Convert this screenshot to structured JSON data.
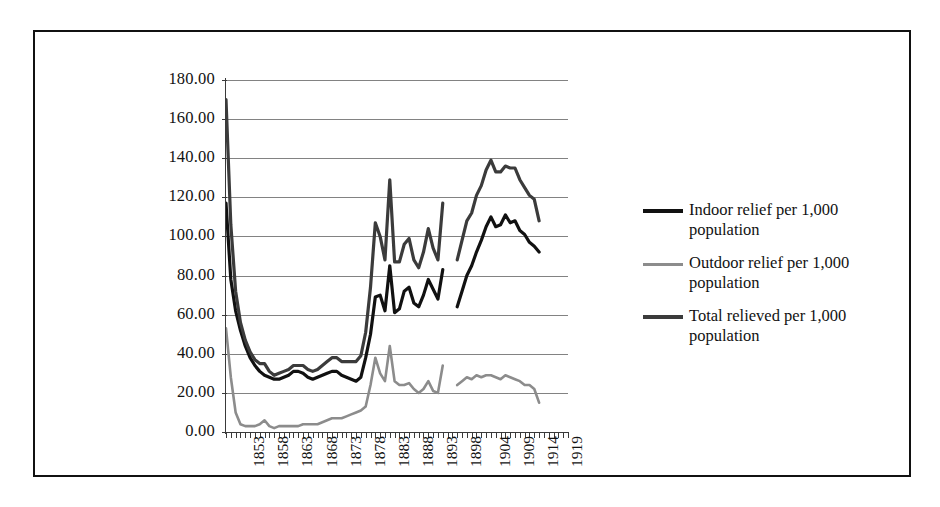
{
  "figure": {
    "background": "#ffffff",
    "frame_color": "#111111"
  },
  "chart_data": {
    "type": "line",
    "title": "",
    "subtitle": "",
    "xlabel": "",
    "ylabel": "",
    "grid": true,
    "legend_position": "right",
    "xlim": [
      1849,
      1920
    ],
    "ylim": [
      0,
      180
    ],
    "y_ticks": [
      "0.00",
      "20.00",
      "40.00",
      "60.00",
      "80.00",
      "100.00",
      "120.00",
      "140.00",
      "160.00",
      "180.00"
    ],
    "y_tick_values": [
      0,
      20,
      40,
      60,
      80,
      100,
      120,
      140,
      160,
      180
    ],
    "x_tick_labels": [
      "1853",
      "1858",
      "1863",
      "1868",
      "1873",
      "1878",
      "1883",
      "1888",
      "1893",
      "1898",
      "1904",
      "1909",
      "1914",
      "1919"
    ],
    "x_tick_values": [
      1853,
      1858,
      1863,
      1868,
      1873,
      1878,
      1883,
      1888,
      1893,
      1898,
      1904,
      1909,
      1914,
      1919
    ],
    "x_start": 1849,
    "gap_years": [
      1895,
      1896
    ],
    "colors": {
      "indoor": "#111111",
      "outdoor": "#8c8c8c",
      "total": "#3b3b3b"
    },
    "x": [
      1849,
      1850,
      1851,
      1852,
      1853,
      1854,
      1855,
      1856,
      1857,
      1858,
      1859,
      1860,
      1861,
      1862,
      1863,
      1864,
      1865,
      1866,
      1867,
      1868,
      1869,
      1870,
      1871,
      1872,
      1873,
      1874,
      1875,
      1876,
      1877,
      1878,
      1879,
      1880,
      1881,
      1882,
      1883,
      1884,
      1885,
      1886,
      1887,
      1888,
      1889,
      1890,
      1891,
      1892,
      1893,
      1894,
      1897,
      1898,
      1899,
      1900,
      1901,
      1902,
      1903,
      1904,
      1905,
      1906,
      1907,
      1908,
      1909,
      1910,
      1911,
      1912,
      1913,
      1914
    ],
    "series": [
      {
        "name": "Indoor relief per 1,000 population",
        "key": "indoor",
        "color": "#111111",
        "values": [
          117,
          78,
          62,
          52,
          44,
          38,
          34,
          31,
          29,
          28,
          27,
          27,
          28,
          29,
          31,
          31,
          30,
          28,
          27,
          28,
          29,
          30,
          31,
          31,
          29,
          28,
          27,
          26,
          28,
          38,
          50,
          69,
          70,
          62,
          85,
          61,
          63,
          72,
          74,
          66,
          64,
          70,
          78,
          73,
          68,
          83,
          64,
          72,
          80,
          85,
          92,
          98,
          105,
          110,
          105,
          106,
          111,
          107,
          108,
          103,
          101,
          97,
          95,
          92
        ]
      },
      {
        "name": "Outdoor relief per 1,000 population",
        "key": "outdoor",
        "color": "#8c8c8c",
        "values": [
          53,
          28,
          10,
          4,
          3,
          3,
          3,
          4,
          6,
          3,
          2,
          3,
          3,
          3,
          3,
          3,
          4,
          4,
          4,
          4,
          5,
          6,
          7,
          7,
          7,
          8,
          9,
          10,
          11,
          13,
          24,
          38,
          30,
          26,
          44,
          26,
          24,
          24,
          25,
          22,
          20,
          22,
          26,
          21,
          20,
          34,
          24,
          26,
          28,
          27,
          29,
          28,
          29,
          29,
          28,
          27,
          29,
          28,
          27,
          26,
          24,
          24,
          22,
          15
        ]
      },
      {
        "name": "Total relieved per 1,000 population",
        "key": "total",
        "color": "#3b3b3b",
        "values": [
          170,
          106,
          72,
          56,
          47,
          41,
          37,
          35,
          35,
          31,
          29,
          30,
          31,
          32,
          34,
          34,
          34,
          32,
          31,
          32,
          34,
          36,
          38,
          38,
          36,
          36,
          36,
          36,
          39,
          51,
          74,
          107,
          100,
          88,
          129,
          87,
          87,
          96,
          99,
          88,
          84,
          92,
          104,
          94,
          88,
          117,
          88,
          98,
          108,
          112,
          121,
          126,
          134,
          139,
          133,
          133,
          136,
          135,
          135,
          129,
          125,
          121,
          119,
          108
        ]
      }
    ]
  },
  "legend": {
    "items": [
      {
        "label": "Indoor relief per 1,000 population",
        "color": "#111111",
        "weight": "thick"
      },
      {
        "label": "Outdoor relief per 1,000 population",
        "color": "#8c8c8c",
        "weight": "thin"
      },
      {
        "label": "Total relieved per 1,000 population",
        "color": "#3b3b3b",
        "weight": "thick"
      }
    ]
  }
}
